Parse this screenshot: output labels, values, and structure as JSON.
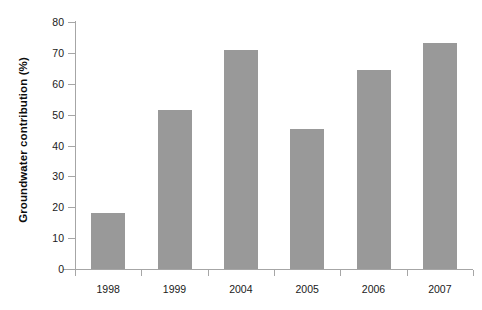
{
  "chart_data": {
    "type": "bar",
    "title": "",
    "xlabel": "",
    "ylabel": "Groundwater contribution (%)",
    "categories": [
      "1998",
      "1999",
      "2004",
      "2005",
      "2006",
      "2007"
    ],
    "values": [
      18.0,
      51.5,
      70.8,
      45.5,
      64.3,
      73.2
    ],
    "series": [
      {
        "name": "Groundwater contribution",
        "values": [
          18.0,
          51.5,
          70.8,
          45.5,
          64.3,
          73.2
        ]
      }
    ],
    "ylim": [
      0,
      80
    ],
    "ytick_step": 10,
    "yticks": [
      "0",
      "10",
      "20",
      "30",
      "40",
      "50",
      "60",
      "70",
      "80"
    ],
    "grid": false,
    "legend": false,
    "legend_position": "none",
    "bar_color": "#999999",
    "axis_color": "#a6a6a6",
    "background_color": "#ffffff",
    "text_color": "#1a1a1a"
  }
}
